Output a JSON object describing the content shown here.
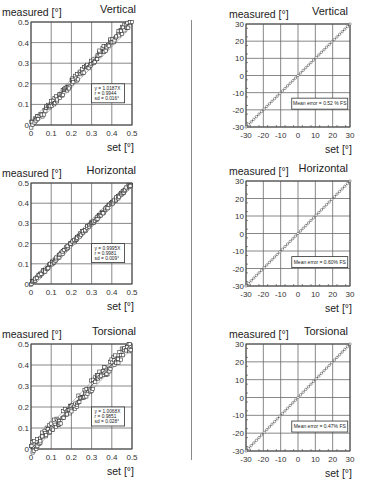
{
  "layout": {
    "divider": true
  },
  "chart_data": [
    {
      "id": "left-vertical",
      "type": "scatter",
      "title": "Vertical",
      "ylabel": "measured [°]",
      "xlabel": "set [°]",
      "xlim": [
        0,
        0.5
      ],
      "ylim": [
        0,
        0.5
      ],
      "xticks": [
        "0",
        "0.1",
        "0.2",
        "0.3",
        "0.4",
        "0.5"
      ],
      "yticks": [
        "0",
        "0.1",
        "0.2",
        "0.3",
        "0.4",
        "0.5"
      ],
      "grid": true,
      "annotation": [
        "y = 1.0187X",
        "r = 0.9944",
        "sd = 0.016°"
      ],
      "fit": {
        "slope": 1.0187,
        "r": 0.9944,
        "sd": 0.016
      },
      "marker": "open-square",
      "frame": {
        "x": 31,
        "y": 22,
        "w": 101,
        "h": 103
      },
      "noise": 0.018
    },
    {
      "id": "right-vertical",
      "type": "line",
      "title": "Vertical",
      "ylabel": "measured [°]",
      "xlabel": "set [°]",
      "xlim": [
        -30,
        30
      ],
      "ylim": [
        -30,
        30
      ],
      "xticks": [
        "-30",
        "-20",
        "-10",
        "0",
        "10",
        "20",
        "30"
      ],
      "yticks": [
        "-30",
        "-20",
        "-10",
        "0",
        "10",
        "20",
        "30"
      ],
      "grid": true,
      "annotation": [
        "Mean error = 0.52 % FS"
      ],
      "mean_error_pct_fs": 0.52,
      "marker": "open-circle",
      "frame": {
        "x": 246,
        "y": 24,
        "w": 104,
        "h": 103
      }
    },
    {
      "id": "left-horizontal",
      "type": "scatter",
      "title": "Horizontal",
      "ylabel": "measured [°]",
      "xlabel": "set [°]",
      "xlim": [
        0,
        0.5
      ],
      "ylim": [
        0,
        0.5
      ],
      "xticks": [
        "0",
        "0.1",
        "0.2",
        "0.3",
        "0.4",
        "0.5"
      ],
      "yticks": [
        "0",
        "0.1",
        "0.2",
        "0.3",
        "0.4",
        "0.5"
      ],
      "grid": true,
      "annotation": [
        "y = 0.9995X",
        "r = 0.9981",
        "sd = 0.009°"
      ],
      "fit": {
        "slope": 0.9995,
        "r": 0.9981,
        "sd": 0.009
      },
      "marker": "open-square",
      "frame": {
        "x": 31,
        "y": 183,
        "w": 101,
        "h": 101
      },
      "noise": 0.009
    },
    {
      "id": "right-horizontal",
      "type": "line",
      "title": "Horizontal",
      "ylabel": "measured [°]",
      "xlabel": "set [°]",
      "xlim": [
        -30,
        30
      ],
      "ylim": [
        -30,
        30
      ],
      "xticks": [
        "-30",
        "-20",
        "-10",
        "0",
        "10",
        "20",
        "30"
      ],
      "yticks": [
        "-30",
        "-20",
        "-10",
        "0",
        "10",
        "20",
        "30"
      ],
      "grid": true,
      "annotation": [
        "Mean error = 0.60% FS"
      ],
      "mean_error_pct_fs": 0.6,
      "marker": "open-circle",
      "frame": {
        "x": 246,
        "y": 181,
        "w": 104,
        "h": 105
      }
    },
    {
      "id": "left-torsional",
      "type": "scatter",
      "title": "Torsional",
      "ylabel": "measured [°]",
      "xlabel": "set [°]",
      "xlim": [
        0,
        0.5
      ],
      "ylim": [
        0,
        0.5
      ],
      "xticks": [
        "0",
        "0.1",
        "0.2",
        "0.3",
        "0.4",
        "0.5"
      ],
      "yticks": [
        "0",
        "0.1",
        "0.2",
        "0.3",
        "0.4",
        "0.5"
      ],
      "grid": true,
      "annotation": [
        "y = 1.0068X",
        "r = 0.9851",
        "sd = 0.028°"
      ],
      "fit": {
        "slope": 1.0068,
        "r": 0.9851,
        "sd": 0.028
      },
      "marker": "open-square",
      "frame": {
        "x": 31,
        "y": 344,
        "w": 101,
        "h": 105
      },
      "noise": 0.028
    },
    {
      "id": "right-torsional",
      "type": "line",
      "title": "Torsional",
      "ylabel": "measured [°]",
      "xlabel": "set [°]",
      "xlim": [
        -30,
        30
      ],
      "ylim": [
        -30,
        30
      ],
      "xticks": [
        "-30",
        "-20",
        "-10",
        "0",
        "10",
        "20",
        "30"
      ],
      "yticks": [
        "-30",
        "-20",
        "-10",
        "0",
        "10",
        "20",
        "30"
      ],
      "grid": true,
      "annotation": [
        "Mean error = 0.47% FS"
      ],
      "mean_error_pct_fs": 0.47,
      "marker": "open-circle",
      "frame": {
        "x": 246,
        "y": 344,
        "w": 104,
        "h": 107
      }
    }
  ]
}
